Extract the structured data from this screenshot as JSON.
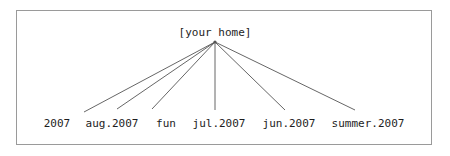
{
  "diagram": {
    "type": "radial-tree",
    "title_text": "",
    "border_color": "#9a9a9a",
    "line_color": "#555555",
    "text_color": "#1d1d1d",
    "background_color": "#ffffff",
    "root": {
      "label": "[your home]",
      "x": 215,
      "y": 42
    },
    "leaves": [
      {
        "label": "2007",
        "text_x": 57,
        "text_y": 118,
        "edge_end_x": 84,
        "edge_end_y": 112
      },
      {
        "label": "aug.2007",
        "text_x": 112,
        "text_y": 118,
        "edge_end_x": 117,
        "edge_end_y": 109
      },
      {
        "label": "fun",
        "text_x": 166,
        "text_y": 118,
        "edge_end_x": 152,
        "edge_end_y": 109
      },
      {
        "label": "jul.2007",
        "text_x": 219,
        "text_y": 118,
        "edge_end_x": 215,
        "edge_end_y": 110
      },
      {
        "label": "jun.2007",
        "text_x": 289,
        "text_y": 118,
        "edge_end_x": 285,
        "edge_end_y": 110
      },
      {
        "label": "summer.2007",
        "text_x": 368,
        "text_y": 118,
        "edge_end_x": 355,
        "edge_end_y": 110
      }
    ]
  }
}
